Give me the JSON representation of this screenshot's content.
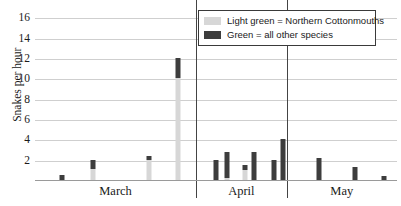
{
  "chart_data": {
    "type": "bar",
    "title": "",
    "subtitle": "",
    "xlabel": "",
    "ylabel": "Snakes per hour",
    "ylim": [
      0,
      17
    ],
    "yticks": [
      2,
      4,
      6,
      8,
      10,
      12,
      14,
      16
    ],
    "grid": true,
    "stacked": true,
    "legend_position": "top-right",
    "categories": [
      "March",
      "April",
      "May"
    ],
    "legend": [
      {
        "label": "Light green = Northern Cottonmouths",
        "color": "#d7d7d7",
        "swatch": "light-green"
      },
      {
        "label": "Green = all other species",
        "color": "#3d3d3d",
        "swatch": "green"
      }
    ],
    "series": [
      {
        "name": "Northern Cottonmouths",
        "color": "#d7d7d7"
      },
      {
        "name": "all other species",
        "color": "#3d3d3d"
      }
    ],
    "month_boundaries_x": [
      44.5,
      69.5
    ],
    "bars": [
      {
        "month": "March",
        "x": 7.5,
        "light": 0.0,
        "dark": 0.5,
        "total": 0.5
      },
      {
        "month": "March",
        "x": 16.0,
        "light": 1.1,
        "dark": 0.9,
        "total": 2.0
      },
      {
        "month": "March",
        "x": 31.5,
        "light": 2.0,
        "dark": 0.4,
        "total": 2.4
      },
      {
        "month": "March",
        "x": 39.5,
        "light": 10.0,
        "dark": 2.0,
        "total": 12.0
      },
      {
        "month": "April",
        "x": 50.0,
        "light": 0.0,
        "dark": 2.0,
        "total": 2.0
      },
      {
        "month": "April",
        "x": 53.0,
        "light": 0.2,
        "dark": 2.6,
        "total": 2.8
      },
      {
        "month": "April",
        "x": 58.0,
        "light": 1.0,
        "dark": 0.5,
        "total": 1.5
      },
      {
        "month": "April",
        "x": 60.5,
        "light": 0.0,
        "dark": 2.8,
        "total": 2.8
      },
      {
        "month": "April",
        "x": 66.0,
        "light": 0.0,
        "dark": 2.0,
        "total": 2.0
      },
      {
        "month": "April",
        "x": 68.5,
        "light": 0.0,
        "dark": 4.0,
        "total": 4.0
      },
      {
        "month": "May",
        "x": 78.5,
        "light": 0.0,
        "dark": 2.2,
        "total": 2.2
      },
      {
        "month": "May",
        "x": 88.5,
        "light": 0.0,
        "dark": 1.3,
        "total": 1.3
      },
      {
        "month": "May",
        "x": 96.5,
        "light": 0.0,
        "dark": 0.4,
        "total": 0.4
      }
    ]
  }
}
